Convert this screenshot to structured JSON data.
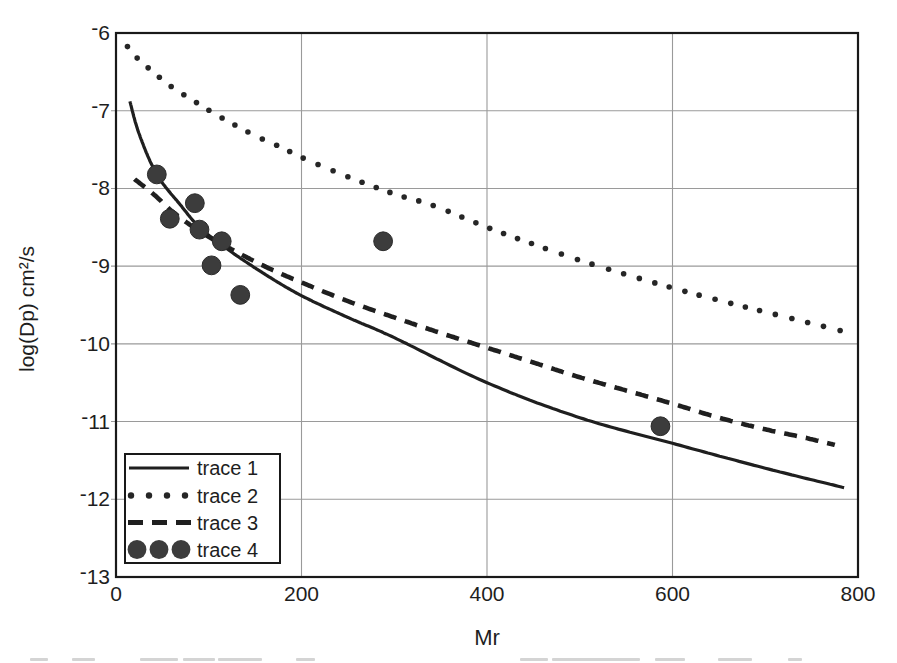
{
  "figure": {
    "background": "#ffffff"
  },
  "chart_data": {
    "type": "line",
    "title": "",
    "xlabel": "Mr",
    "ylabel": "log(Dp)  cm²/s",
    "xlim": [
      0,
      800
    ],
    "ylim": [
      -13,
      -6
    ],
    "x_tick_labels": [
      "0",
      "200",
      "400",
      "600",
      "800"
    ],
    "x_tick_values": [
      0,
      200,
      400,
      600,
      800
    ],
    "y_tick_labels": [
      "-6",
      "-7",
      "-8",
      "-9",
      "-10",
      "-11",
      "-12",
      "-13"
    ],
    "y_tick_values": [
      -6,
      -7,
      -8,
      -9,
      -10,
      -11,
      -12,
      -13
    ],
    "grid": true,
    "legend_position": "bottom-left",
    "colors": {
      "line": "#1f1f1f",
      "grid": "#9a9a9a",
      "marker": "#3c3c3c",
      "border": "#191919",
      "text": "#1e1e1e"
    },
    "series": [
      {
        "name": "trace 1",
        "type": "line",
        "style": "solid",
        "points": [
          [
            15,
            -6.88
          ],
          [
            25,
            -7.3
          ],
          [
            44,
            -7.82
          ],
          [
            70,
            -8.22
          ],
          [
            90,
            -8.5
          ],
          [
            120,
            -8.78
          ],
          [
            160,
            -9.1
          ],
          [
            200,
            -9.38
          ],
          [
            250,
            -9.66
          ],
          [
            300,
            -9.92
          ],
          [
            400,
            -10.5
          ],
          [
            500,
            -10.95
          ],
          [
            600,
            -11.28
          ],
          [
            700,
            -11.6
          ],
          [
            785,
            -11.85
          ]
        ]
      },
      {
        "name": "trace 2",
        "type": "line",
        "style": "dotted",
        "points": [
          [
            12,
            -6.17
          ],
          [
            25,
            -6.35
          ],
          [
            40,
            -6.5
          ],
          [
            55,
            -6.65
          ],
          [
            70,
            -6.77
          ],
          [
            86,
            -6.89
          ],
          [
            101,
            -7.0
          ],
          [
            120,
            -7.13
          ],
          [
            150,
            -7.32
          ],
          [
            180,
            -7.48
          ],
          [
            200,
            -7.6
          ],
          [
            250,
            -7.85
          ],
          [
            300,
            -8.07
          ],
          [
            342,
            -8.22
          ],
          [
            400,
            -8.5
          ],
          [
            460,
            -8.76
          ],
          [
            520,
            -9.0
          ],
          [
            600,
            -9.28
          ],
          [
            660,
            -9.47
          ],
          [
            714,
            -9.63
          ],
          [
            788,
            -9.85
          ]
        ]
      },
      {
        "name": "trace 3",
        "type": "line",
        "style": "dashed",
        "points": [
          [
            20,
            -7.88
          ],
          [
            42,
            -8.09
          ],
          [
            61,
            -8.3
          ],
          [
            90,
            -8.55
          ],
          [
            121,
            -8.76
          ],
          [
            160,
            -9.0
          ],
          [
            200,
            -9.21
          ],
          [
            250,
            -9.45
          ],
          [
            300,
            -9.66
          ],
          [
            350,
            -9.86
          ],
          [
            400,
            -10.05
          ],
          [
            450,
            -10.24
          ],
          [
            500,
            -10.43
          ],
          [
            550,
            -10.6
          ],
          [
            600,
            -10.77
          ],
          [
            650,
            -10.95
          ],
          [
            700,
            -11.1
          ],
          [
            740,
            -11.2
          ],
          [
            775,
            -11.3
          ]
        ]
      },
      {
        "name": "trace 4",
        "type": "scatter",
        "points": [
          [
            44,
            -7.82
          ],
          [
            58,
            -8.39
          ],
          [
            85,
            -8.19
          ],
          [
            90,
            -8.53
          ],
          [
            103,
            -8.99
          ],
          [
            114,
            -8.68
          ],
          [
            134,
            -9.37
          ],
          [
            288,
            -8.68
          ],
          [
            587,
            -11.06
          ]
        ]
      }
    ]
  },
  "legend": {
    "items": [
      {
        "label": "trace 1"
      },
      {
        "label": "trace 2"
      },
      {
        "label": "trace 3"
      },
      {
        "label": "trace 4"
      }
    ]
  }
}
